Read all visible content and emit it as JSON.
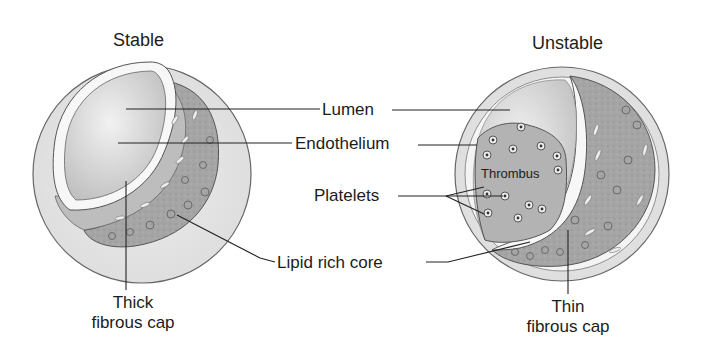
{
  "figure": {
    "panels": [
      {
        "id": "stable",
        "title": "Stable",
        "cap_label": [
          "Thick",
          "fibrous cap"
        ]
      },
      {
        "id": "unstable",
        "title": "Unstable",
        "cap_label": [
          "Thin",
          "fibrous cap"
        ],
        "inner_label": "Thrombus"
      }
    ],
    "center_labels": {
      "lumen": "Lumen",
      "endothelium": "Endothelium",
      "platelets": "Platelets",
      "lipid_core": "Lipid rich core"
    },
    "colors": {
      "vessel_wall": "#e4e4e4",
      "lumen": "#d2d2d2",
      "endothelium": "#f7f7f7",
      "plaque": "#a9a9a9",
      "thrombus": "#b3b3b3",
      "outline": "#555555",
      "leader_line": "#222222"
    }
  }
}
